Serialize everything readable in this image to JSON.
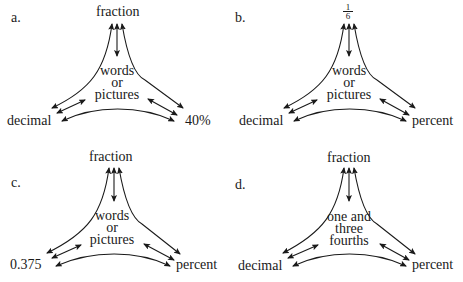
{
  "diagrams": [
    {
      "letter": "a.",
      "top": "fraction",
      "left": "decimal",
      "right": "40%",
      "center": [
        "words",
        "or",
        "pictures"
      ]
    },
    {
      "letter": "b.",
      "top_fraction": {
        "numerator": "1",
        "denominator": "6"
      },
      "left": "decimal",
      "right": "percent",
      "center": [
        "words",
        "or",
        "pictures"
      ]
    },
    {
      "letter": "c.",
      "top": "fraction",
      "left": "0.375",
      "right": "percent",
      "center": [
        "words",
        "or",
        "pictures"
      ]
    },
    {
      "letter": "d.",
      "top": "fraction",
      "left": "decimal",
      "right": "percent",
      "center": [
        "one and",
        "three",
        "fourths"
      ]
    }
  ],
  "colors": {
    "ink": "#1a1a1a",
    "background": "#ffffff"
  }
}
